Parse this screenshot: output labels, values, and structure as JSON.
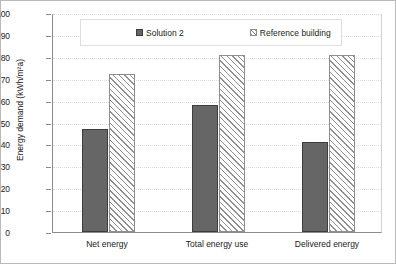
{
  "chart_data": {
    "type": "bar",
    "title": "",
    "xlabel": "",
    "ylabel": "Energy demand (kWh/m²a)",
    "ylim": [
      0,
      100
    ],
    "ytick_step": 10,
    "yticks": [
      "100",
      "90",
      "80",
      "70",
      "60",
      "50",
      "40",
      "30",
      "20",
      "10",
      "0"
    ],
    "grid": true,
    "legend_position": "top-center",
    "categories": [
      "Net energy",
      "Total energy use",
      "Delivered energy"
    ],
    "series": [
      {
        "name": "Solution 2",
        "values": [
          47,
          58,
          41
        ],
        "fill": "solid",
        "color": "#666666",
        "edge_color": "#3d3d3d"
      },
      {
        "name": "Reference building",
        "values": [
          72,
          81,
          81
        ],
        "fill": "diagonal-hatch",
        "color": "#ffffff",
        "edge_color": "#8e8e8e"
      }
    ]
  },
  "legend": {
    "items": [
      {
        "label": "Solution 2",
        "swatch": "solid-square-icon"
      },
      {
        "label": "Reference building",
        "swatch": "hatched-square-icon"
      }
    ]
  }
}
